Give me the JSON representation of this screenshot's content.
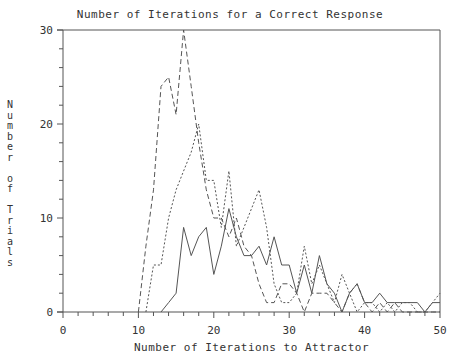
{
  "chart_data": {
    "type": "line",
    "title": "Number of Iterations for a Correct Response",
    "xlabel": "Number of Iterations to Attractor",
    "ylabel": "Number of Trials",
    "xlim": [
      0,
      50
    ],
    "ylim": [
      0,
      30
    ],
    "xticks": [
      0,
      10,
      20,
      30,
      40,
      50
    ],
    "yticks": [
      0,
      10,
      20,
      30
    ],
    "grid": false,
    "legend": null,
    "series": [
      {
        "name": "dashed",
        "style": "dashed",
        "x": [
          10,
          11,
          12,
          13,
          14,
          15,
          16,
          17,
          18,
          19,
          20,
          21,
          22,
          23,
          24,
          25,
          26,
          27,
          28,
          29,
          30,
          31,
          32,
          33,
          34,
          35,
          36,
          37,
          38,
          39,
          40,
          41,
          42,
          43,
          44,
          45,
          46,
          47,
          48,
          49,
          50
        ],
        "values": [
          0,
          7,
          13,
          24,
          25,
          21,
          30,
          24,
          18,
          13,
          10,
          10,
          8,
          10,
          7,
          6,
          3,
          1,
          1,
          3,
          3,
          2,
          0,
          2,
          2,
          2,
          1,
          0,
          2,
          3,
          1,
          0,
          1,
          0,
          1,
          0,
          0,
          0,
          0,
          0,
          0
        ]
      },
      {
        "name": "dotted",
        "style": "dotted",
        "x": [
          11,
          12,
          13,
          14,
          15,
          16,
          17,
          18,
          19,
          20,
          21,
          22,
          23,
          24,
          25,
          26,
          27,
          28,
          29,
          30,
          31,
          32,
          33,
          34,
          35,
          36,
          37,
          38,
          39,
          40,
          41,
          42,
          43,
          44,
          45,
          46,
          47,
          48,
          49,
          50
        ],
        "values": [
          0,
          5,
          5,
          10,
          13,
          15,
          17,
          20,
          14,
          14,
          9,
          15,
          7,
          9,
          11,
          13,
          9,
          3,
          1,
          1,
          2,
          7,
          3,
          5,
          3,
          1,
          4,
          2,
          0,
          1,
          1,
          0,
          1,
          0,
          1,
          1,
          0,
          0,
          1,
          2
        ]
      },
      {
        "name": "solid",
        "style": "solid",
        "x": [
          13,
          14,
          15,
          16,
          17,
          18,
          19,
          20,
          21,
          22,
          23,
          24,
          25,
          26,
          27,
          28,
          29,
          30,
          31,
          32,
          33,
          34,
          35,
          36,
          37,
          38,
          39,
          40,
          41,
          42,
          43,
          44,
          45,
          46,
          47,
          48,
          49,
          50
        ],
        "values": [
          0,
          1,
          2,
          9,
          6,
          8,
          9,
          4,
          7,
          11,
          8,
          6,
          6,
          7,
          5,
          8,
          5,
          5,
          2,
          5,
          2,
          6,
          3,
          2,
          0,
          2,
          3,
          1,
          1,
          2,
          1,
          1,
          1,
          1,
          1,
          0,
          1,
          1
        ]
      }
    ]
  },
  "labels": {
    "title": "Number of Iterations for a Correct Response",
    "xlabel": "Number of Iterations to Attractor",
    "ylabel_vertical": "N\nu\nm\nb\ne\nr\n\no\nf\n\nT\nr\ni\na\nl\ns"
  },
  "colors": {
    "axis": "#555555",
    "line": "#555555",
    "background": "#ffffff"
  }
}
